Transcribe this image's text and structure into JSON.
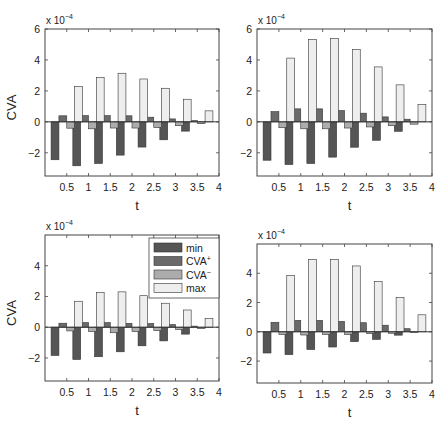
{
  "chart_data": [
    {
      "type": "bar",
      "panel": "top-left",
      "title": "",
      "xlabel": "t",
      "ylabel": "CVA",
      "y_multiplier": "x 10^-4",
      "xlim": [
        0,
        4
      ],
      "ylim": [
        -3.5,
        6
      ],
      "xticks": [
        "0.5",
        "1",
        "1.5",
        "2",
        "2.5",
        "3",
        "3.5",
        "4"
      ],
      "yticks": [
        "6",
        "4",
        "2",
        "0",
        "-2"
      ],
      "grid": false,
      "categories": [
        0.5,
        1,
        1.5,
        2,
        2.5,
        3,
        3.5
      ],
      "series": [
        {
          "name": "min",
          "values": [
            -2.45,
            -2.84,
            -2.69,
            -2.15,
            -1.63,
            -1.16,
            -0.6
          ]
        },
        {
          "name": "CVA+",
          "values": [
            0.39,
            0.4,
            0.4,
            0.39,
            0.3,
            0.19,
            0.08
          ]
        },
        {
          "name": "CVA-",
          "values": [
            -0.41,
            -0.45,
            -0.4,
            -0.4,
            -0.37,
            -0.25,
            -0.12
          ]
        },
        {
          "name": "max",
          "values": [
            2.28,
            2.86,
            3.14,
            2.77,
            2.17,
            1.46,
            0.71
          ]
        }
      ]
    },
    {
      "type": "bar",
      "panel": "top-right",
      "title": "",
      "xlabel": "t",
      "ylabel": "",
      "y_multiplier": "x 10^-4",
      "xlim": [
        0,
        4
      ],
      "ylim": [
        -3.5,
        6
      ],
      "xticks": [
        "0.5",
        "1",
        "1.5",
        "2",
        "2.5",
        "3",
        "3.5",
        "4"
      ],
      "yticks": [
        "6",
        "4",
        "2",
        "0",
        "-2"
      ],
      "grid": false,
      "categories": [
        0.5,
        1,
        1.5,
        2,
        2.5,
        3,
        3.5
      ],
      "series": [
        {
          "name": "min",
          "values": [
            -2.48,
            -2.76,
            -2.69,
            -2.28,
            -1.64,
            -1.19,
            -0.61
          ]
        },
        {
          "name": "CVA+",
          "values": [
            0.66,
            0.84,
            0.84,
            0.73,
            0.56,
            0.32,
            0.17
          ]
        },
        {
          "name": "CVA-",
          "values": [
            -0.38,
            -0.45,
            -0.45,
            -0.4,
            -0.33,
            -0.25,
            -0.15
          ]
        },
        {
          "name": "max",
          "values": [
            4.12,
            5.33,
            5.39,
            4.68,
            3.55,
            2.39,
            1.12
          ]
        }
      ]
    },
    {
      "type": "bar",
      "panel": "bottom-left",
      "title": "",
      "xlabel": "t",
      "ylabel": "CVA",
      "y_multiplier": "x 10^-4",
      "xlim": [
        0,
        4
      ],
      "ylim": [
        -3.5,
        6
      ],
      "xticks": [
        "0.5",
        "1",
        "1.5",
        "2",
        "2.5",
        "3",
        "3.5",
        "4"
      ],
      "yticks": [
        "4",
        "2",
        "0",
        "-2"
      ],
      "grid": false,
      "legend": {
        "position": "upper right",
        "entries": [
          "min",
          "CVA+",
          "CVA-",
          "max"
        ]
      },
      "categories": [
        0.5,
        1,
        1.5,
        2,
        2.5,
        3,
        3.5
      ],
      "series": [
        {
          "name": "min",
          "values": [
            -1.84,
            -2.1,
            -1.92,
            -1.6,
            -1.21,
            -0.89,
            -0.45
          ]
        },
        {
          "name": "CVA+",
          "values": [
            0.26,
            0.3,
            0.3,
            0.25,
            0.24,
            0.17,
            0.07
          ]
        },
        {
          "name": "CVA-",
          "values": [
            -0.24,
            -0.28,
            -0.36,
            -0.28,
            -0.22,
            -0.15,
            -0.08
          ]
        },
        {
          "name": "max",
          "values": [
            1.69,
            2.25,
            2.3,
            2.05,
            1.56,
            1.12,
            0.56
          ]
        }
      ]
    },
    {
      "type": "bar",
      "panel": "bottom-right",
      "title": "",
      "xlabel": "t",
      "ylabel": "",
      "y_multiplier": "x 10^-4",
      "xlim": [
        0,
        4
      ],
      "ylim": [
        -3.5,
        6
      ],
      "xticks": [
        "0.5",
        "1",
        "1.5",
        "2",
        "2.5",
        "3",
        "3.5",
        "4"
      ],
      "yticks": [
        "4",
        "2",
        "0",
        "-2"
      ],
      "grid": false,
      "categories": [
        0.5,
        1,
        1.5,
        2,
        2.5,
        3,
        3.5
      ],
      "series": [
        {
          "name": "min",
          "values": [
            -1.45,
            -1.56,
            -1.21,
            -1.04,
            -0.67,
            -0.52,
            -0.23
          ]
        },
        {
          "name": "CVA+",
          "values": [
            0.65,
            0.78,
            0.78,
            0.71,
            0.62,
            0.45,
            0.21
          ]
        },
        {
          "name": "CVA-",
          "values": [
            -0.18,
            -0.22,
            -0.18,
            -0.18,
            -0.12,
            -0.1,
            -0.06
          ]
        },
        {
          "name": "max",
          "values": [
            3.86,
            4.94,
            4.94,
            4.5,
            3.44,
            2.33,
            1.16
          ]
        }
      ]
    }
  ],
  "style": {
    "series_colors": {
      "min": "#555555",
      "CVA+": "#6a6a6a",
      "CVA-": "#acacac",
      "max": "#eeeeee"
    },
    "bar_edge": "#333333",
    "axis_color": "#444444"
  },
  "legend": {
    "entries": [
      {
        "label": "min",
        "sup": ""
      },
      {
        "label": "CVA",
        "sup": "+"
      },
      {
        "label": "CVA",
        "sup": "−"
      },
      {
        "label": "max",
        "sup": ""
      }
    ]
  },
  "multiplier_label": {
    "base": "x 10",
    "exp": "−4"
  }
}
